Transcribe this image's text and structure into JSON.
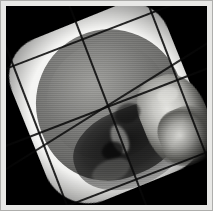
{
  "image": {
    "kind": "radiograph",
    "modality": "X-ray",
    "view": "lateral skull",
    "subject": "human skull",
    "title": "Lateral skull radiograph with treatment-field grid overlay",
    "alt_text": "Black-and-white lateral X-ray of a human skull showing the cranial vault, skull base and facial bones, overlaid with a tilted rectangular grid of thin dark lines, framed by a light border.",
    "orientation": "profile facing right",
    "background_color": "#000000",
    "border_color": "#e8e8e6",
    "caption": ""
  },
  "palette": {
    "film_black": "#000000",
    "paper_border": "#e8e8e6",
    "scalp_white": "#f4f4f2",
    "vault_gray": "#6a6a68",
    "bone_bright": "#d8d8d4",
    "shadow_dark": "#121212",
    "grid_line": "#0a0a0a"
  },
  "regions": [
    {
      "name": "scalp-envelope",
      "label": "Soft tissue / scalp envelope",
      "tone": "bright white"
    },
    {
      "name": "cranial-vault",
      "label": "Cranial vault",
      "tone": "mid gray"
    },
    {
      "name": "brain-cavity",
      "label": "Endocranial cavity",
      "tone": "light gray"
    },
    {
      "name": "skull-base",
      "label": "Skull base and sinus shadow",
      "tone": "dark"
    },
    {
      "name": "facial-bones",
      "label": "Facial and maxillary bones",
      "tone": "bright"
    }
  ],
  "overlay": {
    "name": "field-grid",
    "label": "Treatment field grid",
    "line_color": "#0a0a0a",
    "rotation_degrees": -21,
    "horizontal_lines": 3,
    "vertical_lines": 3,
    "oblique_lines": 1
  }
}
